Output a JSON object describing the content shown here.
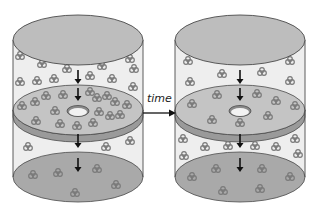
{
  "diagram": {
    "type": "effusion-over-time",
    "label_time": "time",
    "colors": {
      "cylinder_fill": "#eeeeee",
      "cylinder_edge": "#4a4a4a",
      "lid_fill": "#bdbdbd",
      "disc_fill": "#c4c4c4",
      "disc_rim": "#9a9a9a",
      "hole_fill": "#f2f2f2",
      "molecule": "#7a7a7a",
      "arrow": "#111111"
    },
    "panels": [
      {
        "name": "before",
        "cx": 78,
        "upper_molecules": [
          [
            20,
            57
          ],
          [
            42,
            65
          ],
          [
            67,
            70
          ],
          [
            102,
            67
          ],
          [
            130,
            60
          ],
          [
            134,
            70
          ],
          [
            20,
            83
          ],
          [
            37,
            82
          ],
          [
            54,
            80
          ],
          [
            90,
            77
          ],
          [
            112,
            80
          ],
          [
            133,
            88
          ]
        ],
        "disc_molecules": [
          [
            22,
            107
          ],
          [
            35,
            103
          ],
          [
            46,
            97
          ],
          [
            63,
            96
          ],
          [
            90,
            93
          ],
          [
            97,
            99
          ],
          [
            107,
            97
          ],
          [
            115,
            103
          ],
          [
            127,
            106
          ],
          [
            55,
            112
          ],
          [
            99,
            113
          ],
          [
            110,
            117
          ],
          [
            120,
            116
          ],
          [
            36,
            122
          ],
          [
            60,
            125
          ],
          [
            77,
            127
          ],
          [
            93,
            124
          ]
        ],
        "lower_molecules": [
          [
            28,
            148
          ],
          [
            106,
            148
          ],
          [
            130,
            142
          ]
        ],
        "floor_molecules": [
          [
            33,
            176
          ],
          [
            58,
            174
          ],
          [
            97,
            170
          ],
          [
            116,
            186
          ],
          [
            75,
            194
          ]
        ]
      },
      {
        "name": "after",
        "cx": 240,
        "upper_molecules": [
          [
            188,
            62
          ],
          [
            290,
            62
          ],
          [
            222,
            75
          ],
          [
            262,
            73
          ],
          [
            190,
            83
          ],
          [
            290,
            82
          ]
        ],
        "disc_molecules": [
          [
            217,
            96
          ],
          [
            257,
            95
          ],
          [
            192,
            105
          ],
          [
            276,
            102
          ],
          [
            295,
            107
          ],
          [
            212,
            121
          ],
          [
            240,
            124
          ],
          [
            268,
            117
          ]
        ],
        "lower_molecules": [
          [
            183,
            140
          ],
          [
            205,
            148
          ],
          [
            228,
            147
          ],
          [
            255,
            147
          ],
          [
            276,
            148
          ],
          [
            295,
            140
          ],
          [
            184,
            157
          ],
          [
            298,
            155
          ]
        ],
        "floor_molecules": [
          [
            216,
            170
          ],
          [
            262,
            170
          ],
          [
            192,
            178
          ],
          [
            290,
            178
          ],
          [
            223,
            192
          ],
          [
            260,
            190
          ]
        ]
      }
    ]
  }
}
